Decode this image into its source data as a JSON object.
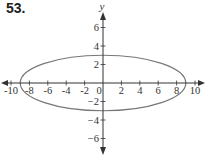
{
  "problem_number": "53.",
  "chart_data": {
    "type": "line",
    "title": "",
    "xlabel": "",
    "ylabel": "y",
    "xlim": [
      -10.5,
      10.5
    ],
    "ylim": [
      -7.5,
      7.5
    ],
    "grid": false,
    "x_ticks": [
      -10,
      -8,
      -6,
      -4,
      -2,
      0,
      2,
      4,
      6,
      8,
      10
    ],
    "y_ticks": [
      -6,
      -4,
      -2,
      2,
      4,
      6
    ],
    "x_tick_labels": [
      "-10",
      "-8",
      "-6",
      "-4",
      "-2",
      "0",
      "2",
      "4",
      "6",
      "8",
      "10"
    ],
    "y_tick_labels": [
      "−6",
      "−4",
      "−2",
      "2",
      "4",
      "6"
    ],
    "series": [
      {
        "name": "ellipse",
        "shape": "ellipse",
        "center": [
          0,
          0
        ],
        "semi_major_x": 9,
        "semi_minor_y": 3,
        "equation": "x^2/81 + y^2/9 = 1",
        "color": "#777777"
      }
    ]
  }
}
